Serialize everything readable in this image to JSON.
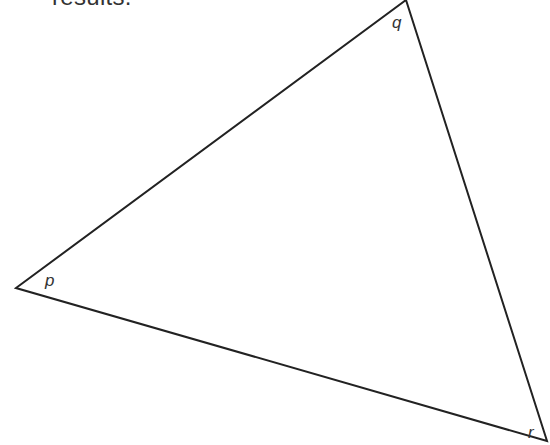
{
  "header_fragment": "results.",
  "triangle": {
    "vertices": {
      "p": {
        "label": "p",
        "x": 16,
        "y": 288
      },
      "q": {
        "label": "q",
        "x": 406,
        "y": 0
      },
      "r": {
        "label": "r",
        "x": 547,
        "y": 441
      }
    },
    "stroke_color": "#222222"
  }
}
